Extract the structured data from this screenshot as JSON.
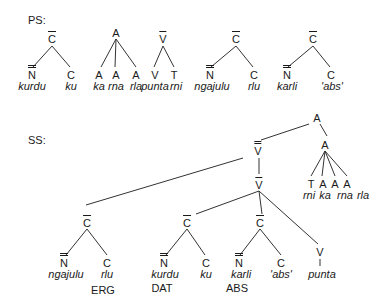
{
  "labels": {
    "ps": "PS:",
    "ss": "SS:"
  },
  "ps_trees": [
    {
      "root": "C",
      "root_bars": 1,
      "children": [
        {
          "cat": "N",
          "bars": 2,
          "word": "kurdu"
        },
        {
          "cat": "C",
          "bars": 0,
          "word": "ku"
        }
      ]
    },
    {
      "root": "A",
      "root_bars": 0,
      "children": [
        {
          "cat": "A",
          "bars": 0,
          "word": "ka"
        },
        {
          "cat": "A",
          "bars": 0,
          "word": "rna"
        },
        {
          "cat": "A",
          "bars": 0,
          "word": "rla"
        }
      ]
    },
    {
      "root": "V",
      "root_bars": 1,
      "children": [
        {
          "cat": "V",
          "bars": 0,
          "word": "punta"
        },
        {
          "cat": "T",
          "bars": 0,
          "word": "rni"
        }
      ]
    },
    {
      "root": "C",
      "root_bars": 1,
      "children": [
        {
          "cat": "N",
          "bars": 2,
          "word": "ngajulu"
        },
        {
          "cat": "C",
          "bars": 0,
          "word": "rlu"
        }
      ]
    },
    {
      "root": "C",
      "root_bars": 1,
      "children": [
        {
          "cat": "N",
          "bars": 2,
          "word": "karli"
        },
        {
          "cat": "C",
          "bars": 0,
          "word": "'abs'"
        }
      ]
    }
  ],
  "ss_tree": {
    "root": "A",
    "vbar2": "V",
    "vbar1": "V",
    "a_inner": "A",
    "erg_c": {
      "root": "C",
      "n": "N",
      "n_word": "ngajulu",
      "c": "C",
      "c_word": "rlu",
      "case": "ERG"
    },
    "dat_c": {
      "root": "C",
      "n": "N",
      "n_word": "kurdu",
      "c": "C",
      "c_word": "ku",
      "case": "DAT"
    },
    "abs_c": {
      "root": "C",
      "n": "N",
      "n_word": "karli",
      "c": "C",
      "c_word": "'abs'",
      "case": "ABS"
    },
    "verb": {
      "cat": "V",
      "word": "punta"
    },
    "affixes": [
      {
        "cat": "T",
        "word": "rni"
      },
      {
        "cat": "A",
        "word": "ka"
      },
      {
        "cat": "A",
        "word": "rna"
      },
      {
        "cat": "A",
        "word": "rla"
      }
    ]
  }
}
